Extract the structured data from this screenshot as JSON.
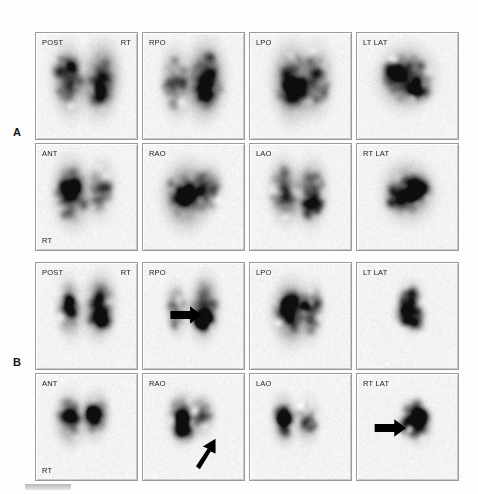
{
  "figure": {
    "background_color": "#fdfdfd",
    "frame_border_color": "#9a9a9a",
    "scan_background_color": "#f2f2f0",
    "activity_color": "#2b2b2b",
    "label_color": "#1a1a1a"
  },
  "panels": [
    {
      "letter": "A",
      "rows": [
        {
          "cells": [
            {
              "view": "POST",
              "label_top_left": "POST",
              "label_top_right": "RT",
              "label_bottom_left": "",
              "arrow": null
            },
            {
              "view": "RPO",
              "label_top_left": "RPO",
              "label_top_right": "",
              "label_bottom_left": "",
              "arrow": null
            },
            {
              "view": "LPO",
              "label_top_left": "LPO",
              "label_top_right": "",
              "label_bottom_left": "",
              "arrow": null
            },
            {
              "view": "LT LAT",
              "label_top_left": "LT LAT",
              "label_top_right": "",
              "label_bottom_left": "",
              "arrow": null
            }
          ]
        },
        {
          "cells": [
            {
              "view": "ANT",
              "label_top_left": "ANT",
              "label_top_right": "",
              "label_bottom_left": "RT",
              "arrow": null
            },
            {
              "view": "RAO",
              "label_top_left": "RAO",
              "label_top_right": "",
              "label_bottom_left": "",
              "arrow": null
            },
            {
              "view": "LAO",
              "label_top_left": "LAO",
              "label_top_right": "",
              "label_bottom_left": "",
              "arrow": null
            },
            {
              "view": "RT LAT",
              "label_top_left": "RT LAT",
              "label_top_right": "",
              "label_bottom_left": "",
              "arrow": null
            }
          ]
        }
      ]
    },
    {
      "letter": "B",
      "rows": [
        {
          "cells": [
            {
              "view": "POST",
              "label_top_left": "POST",
              "label_top_right": "RT",
              "label_bottom_left": "",
              "arrow": null
            },
            {
              "view": "RPO",
              "label_top_left": "RPO",
              "label_top_right": "",
              "label_bottom_left": "",
              "arrow": {
                "direction": "right",
                "x": 30,
                "y": 52,
                "length": 26
              }
            },
            {
              "view": "LPO",
              "label_top_left": "LPO",
              "label_top_right": "",
              "label_bottom_left": "",
              "arrow": null
            },
            {
              "view": "LT LAT",
              "label_top_left": "LT LAT",
              "label_top_right": "",
              "label_bottom_left": "",
              "arrow": null
            }
          ]
        },
        {
          "cells": [
            {
              "view": "ANT",
              "label_top_left": "ANT",
              "label_top_right": "",
              "label_bottom_left": "RT",
              "arrow": null
            },
            {
              "view": "RAO",
              "label_top_left": "RAO",
              "label_top_right": "",
              "label_bottom_left": "",
              "arrow": {
                "direction": "up-right",
                "x": 56,
                "y": 90,
                "length": 24
              }
            },
            {
              "view": "LAO",
              "label_top_left": "LAO",
              "label_top_right": "",
              "label_bottom_left": "",
              "arrow": null
            },
            {
              "view": "RT LAT",
              "label_top_left": "RT LAT",
              "label_top_right": "",
              "label_bottom_left": "",
              "arrow": {
                "direction": "right",
                "x": 20,
                "y": 54,
                "length": 28
              }
            }
          ]
        }
      ]
    }
  ],
  "caption_bar": {
    "visible": true,
    "color": "#c4c4c4"
  }
}
